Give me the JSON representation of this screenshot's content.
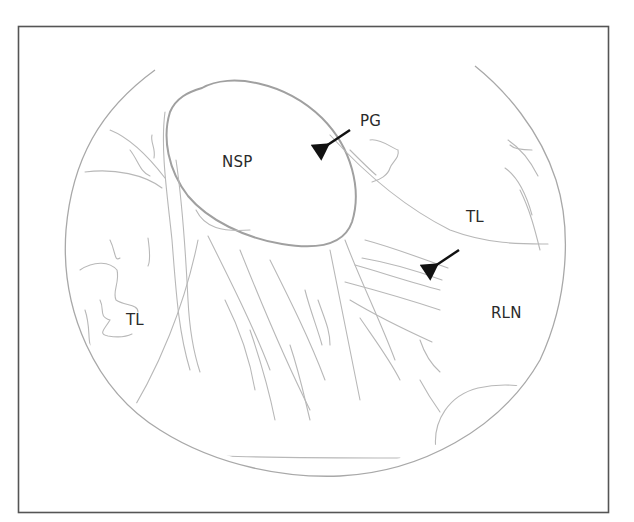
{
  "figure": {
    "type": "anatomical line drawing",
    "view": "circular endoscopic field",
    "frame_color": "#555555",
    "line_color": "#b5b5b5",
    "arrow_color": "#111111",
    "labels": [
      {
        "id": "nsp",
        "text": "NSP",
        "x": 222,
        "y": 153
      },
      {
        "id": "pg",
        "text": "PG",
        "x": 360,
        "y": 112
      },
      {
        "id": "tl-right",
        "text": "TL",
        "x": 466,
        "y": 208
      },
      {
        "id": "rln",
        "text": "RLN",
        "x": 491,
        "y": 304
      },
      {
        "id": "tl-left",
        "text": "TL",
        "x": 126,
        "y": 311
      }
    ],
    "arrows": [
      {
        "id": "arrow-pg",
        "points_to": "NSP capsule margin",
        "from": [
          350,
          130
        ],
        "to": [
          323,
          148
        ]
      },
      {
        "id": "arrow-rln",
        "points_to": "RLN bundle",
        "from": [
          458,
          251
        ],
        "to": [
          431,
          268
        ]
      }
    ]
  }
}
